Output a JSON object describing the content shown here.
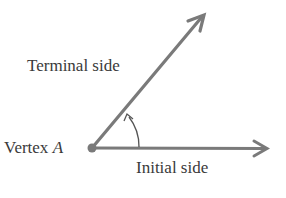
{
  "diagram": {
    "labels": {
      "terminal": "Terminal side",
      "initial": "Initial side",
      "vertex_prefix": "Vertex",
      "vertex_name": "A"
    },
    "colors": {
      "ray": "#7a7a7a",
      "text": "#3a3a3a",
      "background": "#ffffff"
    }
  }
}
